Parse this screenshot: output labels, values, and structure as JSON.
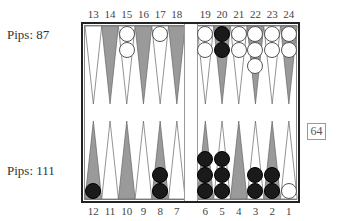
{
  "players": {
    "top": {
      "pips_label": "Pips:  87",
      "color": "white"
    },
    "bottom": {
      "pips_label": "Pips: 111",
      "color": "black"
    }
  },
  "cube": {
    "value": "64"
  },
  "point_labels": {
    "top": [
      "13",
      "14",
      "15",
      "16",
      "17",
      "18",
      "19",
      "20",
      "21",
      "22",
      "23",
      "24"
    ],
    "bottom": [
      "12",
      "11",
      "10",
      "9",
      "8",
      "7",
      "6",
      "5",
      "4",
      "3",
      "2",
      "1"
    ]
  },
  "colors": {
    "light_point": "#ffffff",
    "dark_point": "#9a9a9a",
    "white_checker": "#ffffff",
    "black_checker": "#1a1a1a",
    "frame": "#222222"
  },
  "position": {
    "top": [
      {
        "point": 13,
        "shade": "light",
        "count": 0,
        "color": null
      },
      {
        "point": 14,
        "shade": "dark",
        "count": 0,
        "color": null
      },
      {
        "point": 15,
        "shade": "light",
        "count": 2,
        "color": "white"
      },
      {
        "point": 16,
        "shade": "dark",
        "count": 0,
        "color": null
      },
      {
        "point": 17,
        "shade": "light",
        "count": 1,
        "color": "white"
      },
      {
        "point": 18,
        "shade": "dark",
        "count": 0,
        "color": null
      },
      {
        "point": 19,
        "shade": "light",
        "count": 2,
        "color": "white"
      },
      {
        "point": 20,
        "shade": "dark",
        "count": 2,
        "color": "black"
      },
      {
        "point": 21,
        "shade": "light",
        "count": 2,
        "color": "white"
      },
      {
        "point": 22,
        "shade": "dark",
        "count": 3,
        "color": "white"
      },
      {
        "point": 23,
        "shade": "light",
        "count": 2,
        "color": "white"
      },
      {
        "point": 24,
        "shade": "dark",
        "count": 2,
        "color": "white"
      }
    ],
    "bottom": [
      {
        "point": 12,
        "shade": "dark",
        "count": 1,
        "color": "black"
      },
      {
        "point": 11,
        "shade": "light",
        "count": 0,
        "color": null
      },
      {
        "point": 10,
        "shade": "dark",
        "count": 0,
        "color": null
      },
      {
        "point": 9,
        "shade": "light",
        "count": 0,
        "color": null
      },
      {
        "point": 8,
        "shade": "dark",
        "count": 2,
        "color": "black"
      },
      {
        "point": 7,
        "shade": "light",
        "count": 0,
        "color": null
      },
      {
        "point": 6,
        "shade": "dark",
        "count": 3,
        "color": "black"
      },
      {
        "point": 5,
        "shade": "light",
        "count": 3,
        "color": "black"
      },
      {
        "point": 4,
        "shade": "dark",
        "count": 0,
        "color": null
      },
      {
        "point": 3,
        "shade": "light",
        "count": 2,
        "color": "black"
      },
      {
        "point": 2,
        "shade": "dark",
        "count": 2,
        "color": "black"
      },
      {
        "point": 1,
        "shade": "light",
        "count": 1,
        "color": "white"
      }
    ]
  }
}
